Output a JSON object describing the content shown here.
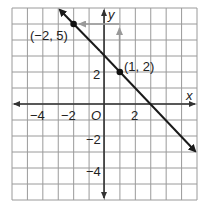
{
  "chart_data": {
    "type": "line",
    "title": "",
    "xlabel": "x",
    "ylabel": "y",
    "xlim": [
      -6,
      6
    ],
    "ylim": [
      -6,
      6
    ],
    "grid": true,
    "origin_label": "O",
    "x_ticks": [
      {
        "value": -4,
        "label": "−4"
      },
      {
        "value": -2,
        "label": "−2"
      },
      {
        "value": 2,
        "label": "2"
      }
    ],
    "y_ticks": [
      {
        "value": 2,
        "label": "2"
      },
      {
        "value": -2,
        "label": "−2"
      },
      {
        "value": -4,
        "label": "−4"
      }
    ],
    "series": [
      {
        "name": "line",
        "slope": -1,
        "intercept": 3,
        "x": [
          -3,
          6
        ],
        "y": [
          6,
          -3
        ],
        "color": "#1a1a1a"
      }
    ],
    "points": [
      {
        "x": -2,
        "y": 5,
        "label": "(−2, 5)"
      },
      {
        "x": 1,
        "y": 2,
        "label": "(1, 2)"
      }
    ],
    "annotations": [
      {
        "type": "arrow",
        "from": [
          1,
          5
        ],
        "to": [
          -2,
          5
        ],
        "meaning": "run = -3",
        "color": "#999999"
      },
      {
        "type": "arrow",
        "from": [
          1,
          2
        ],
        "to": [
          1,
          5
        ],
        "meaning": "rise = 3",
        "color": "#999999"
      }
    ]
  },
  "labels": {
    "x_axis": "x",
    "y_axis": "y",
    "origin": "O",
    "xt_m4": "−4",
    "xt_m2": "−2",
    "xt_2": "2",
    "yt_2": "2",
    "yt_m2": "−2",
    "yt_m4": "−4",
    "p1": "(−2, 5)",
    "p2": "(1, 2)"
  }
}
